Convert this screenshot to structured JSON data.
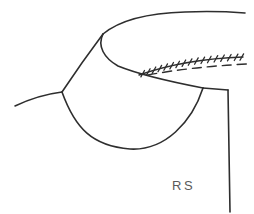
{
  "figure": {
    "background_color": "#ffffff",
    "stroke_color": "#2e2e2e",
    "label": "RS",
    "label_color": "#5a5a5a"
  }
}
